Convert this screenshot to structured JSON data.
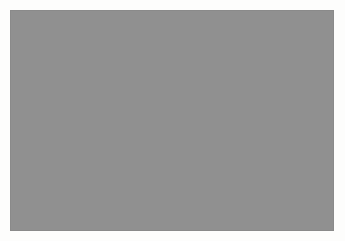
{
  "figure": {
    "kind": "grayscale-micrograph",
    "canvas": {
      "width": 345,
      "height": 241
    },
    "background_color": "#fdfdfc"
  },
  "image_panel": {
    "name": "micrograph-image",
    "left": 10,
    "top": 10,
    "width": 324,
    "height": 221,
    "border_color": "#8a8a8a",
    "border_width": 1
  },
  "texture": {
    "type": "speckle-noise",
    "base_gray": "#909090",
    "mean_level": 144,
    "min_level": 8,
    "max_level": 252,
    "contrast": 1.55,
    "grain_size_px": 1.7,
    "coarse_grain_size_px": 5.0,
    "seed": 20240517,
    "highlight_color": "#f8f8f8",
    "shadow_color": "#0a0a0a",
    "dark_blobs": [
      {
        "x": 0.905,
        "y": 0.115,
        "rx": 0.048,
        "ry": 0.055,
        "strength": 0.95
      },
      {
        "x": 0.852,
        "y": 0.07,
        "rx": 0.03,
        "ry": 0.028,
        "strength": 0.8
      },
      {
        "x": 0.745,
        "y": 0.06,
        "rx": 0.022,
        "ry": 0.024,
        "strength": 0.85
      },
      {
        "x": 0.69,
        "y": 0.12,
        "rx": 0.018,
        "ry": 0.02,
        "strength": 0.7
      },
      {
        "x": 0.505,
        "y": 0.175,
        "rx": 0.026,
        "ry": 0.024,
        "strength": 0.8
      },
      {
        "x": 0.43,
        "y": 0.205,
        "rx": 0.02,
        "ry": 0.018,
        "strength": 0.72
      },
      {
        "x": 0.395,
        "y": 0.235,
        "rx": 0.016,
        "ry": 0.017,
        "strength": 0.65
      },
      {
        "x": 0.232,
        "y": 0.2,
        "rx": 0.02,
        "ry": 0.02,
        "strength": 0.78
      },
      {
        "x": 0.1,
        "y": 0.345,
        "rx": 0.022,
        "ry": 0.026,
        "strength": 0.82
      },
      {
        "x": 0.148,
        "y": 0.525,
        "rx": 0.02,
        "ry": 0.022,
        "strength": 0.75
      },
      {
        "x": 0.25,
        "y": 0.66,
        "rx": 0.018,
        "ry": 0.02,
        "strength": 0.78
      },
      {
        "x": 0.305,
        "y": 0.672,
        "rx": 0.016,
        "ry": 0.016,
        "strength": 0.66
      },
      {
        "x": 0.497,
        "y": 0.52,
        "rx": 0.022,
        "ry": 0.024,
        "strength": 0.85
      },
      {
        "x": 0.545,
        "y": 0.565,
        "rx": 0.018,
        "ry": 0.02,
        "strength": 0.7
      },
      {
        "x": 0.56,
        "y": 0.455,
        "rx": 0.016,
        "ry": 0.018,
        "strength": 0.68
      },
      {
        "x": 0.648,
        "y": 0.655,
        "rx": 0.02,
        "ry": 0.018,
        "strength": 0.72
      },
      {
        "x": 0.702,
        "y": 0.69,
        "rx": 0.016,
        "ry": 0.016,
        "strength": 0.62
      },
      {
        "x": 0.83,
        "y": 0.635,
        "rx": 0.022,
        "ry": 0.024,
        "strength": 0.86
      },
      {
        "x": 0.905,
        "y": 0.445,
        "rx": 0.018,
        "ry": 0.02,
        "strength": 0.74
      },
      {
        "x": 0.96,
        "y": 0.3,
        "rx": 0.016,
        "ry": 0.018,
        "strength": 0.6
      },
      {
        "x": 0.615,
        "y": 0.88,
        "rx": 0.022,
        "ry": 0.022,
        "strength": 0.84
      },
      {
        "x": 0.345,
        "y": 0.96,
        "rx": 0.02,
        "ry": 0.018,
        "strength": 0.76
      },
      {
        "x": 0.148,
        "y": 0.945,
        "rx": 0.018,
        "ry": 0.018,
        "strength": 0.7
      },
      {
        "x": 0.212,
        "y": 0.905,
        "rx": 0.015,
        "ry": 0.015,
        "strength": 0.58
      },
      {
        "x": 0.475,
        "y": 0.775,
        "rx": 0.015,
        "ry": 0.016,
        "strength": 0.6
      },
      {
        "x": 0.79,
        "y": 0.9,
        "rx": 0.016,
        "ry": 0.016,
        "strength": 0.58
      },
      {
        "x": 0.885,
        "y": 0.81,
        "rx": 0.015,
        "ry": 0.015,
        "strength": 0.55
      },
      {
        "x": 0.06,
        "y": 0.76,
        "rx": 0.015,
        "ry": 0.016,
        "strength": 0.55
      }
    ],
    "bright_streaks": [
      {
        "x": 0.085,
        "y": 0.115,
        "rx": 0.085,
        "ry": 0.022,
        "angle": -18,
        "strength": 0.95
      },
      {
        "x": 0.045,
        "y": 0.3,
        "rx": 0.04,
        "ry": 0.03,
        "angle": 30,
        "strength": 0.7
      },
      {
        "x": 0.215,
        "y": 0.355,
        "rx": 0.05,
        "ry": 0.018,
        "angle": 12,
        "strength": 0.65
      },
      {
        "x": 0.4,
        "y": 0.075,
        "rx": 0.045,
        "ry": 0.016,
        "angle": -8,
        "strength": 0.6
      },
      {
        "x": 0.6,
        "y": 0.3,
        "rx": 0.04,
        "ry": 0.016,
        "angle": 22,
        "strength": 0.55
      },
      {
        "x": 0.76,
        "y": 0.24,
        "rx": 0.038,
        "ry": 0.018,
        "angle": -25,
        "strength": 0.58
      },
      {
        "x": 0.93,
        "y": 0.56,
        "rx": 0.035,
        "ry": 0.03,
        "angle": 40,
        "strength": 0.62
      },
      {
        "x": 0.33,
        "y": 0.56,
        "rx": 0.042,
        "ry": 0.018,
        "angle": -15,
        "strength": 0.58
      },
      {
        "x": 0.68,
        "y": 0.47,
        "rx": 0.04,
        "ry": 0.016,
        "angle": 10,
        "strength": 0.52
      },
      {
        "x": 0.2,
        "y": 0.78,
        "rx": 0.045,
        "ry": 0.018,
        "angle": 18,
        "strength": 0.55
      },
      {
        "x": 0.52,
        "y": 0.68,
        "rx": 0.038,
        "ry": 0.016,
        "angle": -20,
        "strength": 0.5
      },
      {
        "x": 0.86,
        "y": 0.72,
        "rx": 0.036,
        "ry": 0.018,
        "angle": 28,
        "strength": 0.52
      }
    ]
  }
}
